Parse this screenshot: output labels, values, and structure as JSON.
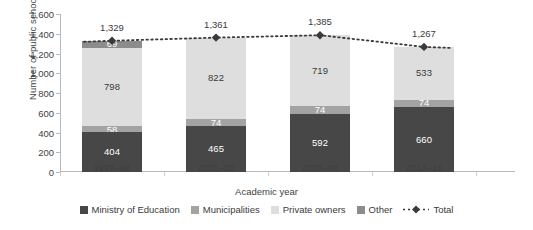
{
  "chart_data": {
    "type": "bar",
    "stacked": true,
    "title": "",
    "xlabel": "Academic year",
    "ylabel": "Number of public schools",
    "categories": [
      "1997–98",
      "2001–02",
      "2007–08",
      "2014–15"
    ],
    "ylim": [
      0,
      1600
    ],
    "yticks": [
      "0",
      "200",
      "400",
      "600",
      "800",
      "1,000",
      "1,200",
      "1,400",
      "1,600"
    ],
    "ytick_values": [
      0,
      200,
      400,
      600,
      800,
      1000,
      1200,
      1400,
      1600
    ],
    "grid": false,
    "legend_position": "bottom",
    "series": [
      {
        "name": "Ministry of Education",
        "color": "#474747",
        "values": [
          404,
          465,
          592,
          660
        ],
        "labels": [
          "404",
          "465",
          "592",
          "660"
        ]
      },
      {
        "name": "Municipalities",
        "color": "#a3a3a3",
        "values": [
          58,
          74,
          74,
          74
        ],
        "labels": [
          "58",
          "74",
          "74",
          "74"
        ]
      },
      {
        "name": "Private owners",
        "color": "#dedede",
        "values": [
          798,
          822,
          719,
          533
        ],
        "labels": [
          "798",
          "822",
          "719",
          "533"
        ]
      },
      {
        "name": "Other",
        "color": "#8c8c8c",
        "values": [
          69,
          0,
          0,
          0
        ],
        "labels": [
          "69",
          "",
          "",
          ""
        ]
      }
    ],
    "total_series": {
      "name": "Total",
      "color": "#3a3a3a",
      "values": [
        1329,
        1361,
        1385,
        1267
      ],
      "labels": [
        "1,329",
        "1,361",
        "1,385",
        "1,267"
      ],
      "style": "dotted-with-diamond-markers"
    }
  },
  "legend": {
    "items": [
      {
        "label": "Ministry of Education",
        "color": "#474747",
        "type": "swatch"
      },
      {
        "label": "Municipalities",
        "color": "#a3a3a3",
        "type": "swatch"
      },
      {
        "label": "Private owners",
        "color": "#dedede",
        "type": "swatch"
      },
      {
        "label": "Other",
        "color": "#8c8c8c",
        "type": "swatch"
      },
      {
        "label": "Total",
        "color": "#3a3a3a",
        "type": "line-marker"
      }
    ]
  }
}
